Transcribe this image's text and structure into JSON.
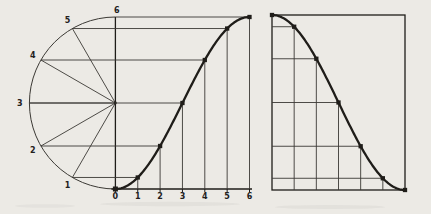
{
  "figure": {
    "background_color": "#ECEAE5",
    "construction_line_color": "#3B3934",
    "curve_color": "#1F1D19",
    "left_panel": {
      "description": "semicircle divided into six equal arcs projecting ordinates onto a rising curve",
      "circle_point_labels": [
        "1",
        "2",
        "3",
        "4",
        "5"
      ],
      "top_point_label": "6",
      "x_axis_labels": [
        "0",
        "1",
        "2",
        "3",
        "4",
        "5",
        "6"
      ],
      "divisions": 6
    },
    "right_panel": {
      "description": "mirrored falling curve in a rectangle with projection grid",
      "divisions": 6
    },
    "chart_data": [
      {
        "type": "line",
        "x": [
          0,
          1,
          2,
          3,
          4,
          5,
          6
        ],
        "y": [
          0,
          0.4,
          1.5,
          3.0,
          4.5,
          5.6,
          6.0
        ],
        "xlim": [
          0,
          6
        ],
        "ylim": [
          0,
          6
        ],
        "grid": "projection lines from semicircle points"
      },
      {
        "type": "line",
        "x": [
          0,
          1,
          2,
          3,
          4,
          5,
          6
        ],
        "y": [
          6.0,
          5.6,
          4.5,
          3.0,
          1.5,
          0.4,
          0
        ],
        "xlim": [
          0,
          6
        ],
        "ylim": [
          0,
          6
        ],
        "grid": "horizontal lines to left edge, vertical lines to bottom edge"
      }
    ],
    "geometry": {
      "left": {
        "cx": 115.4,
        "cy": 103,
        "r": 86,
        "axis_y": 189,
        "top_y": 17,
        "unit_x": 22.35,
        "tick_len": 3,
        "label_row_y": 196.8,
        "label_radius_offset": 9.5
      },
      "right": {
        "x0": 272,
        "y0": 15,
        "x1": 405,
        "y1": 190
      }
    }
  }
}
